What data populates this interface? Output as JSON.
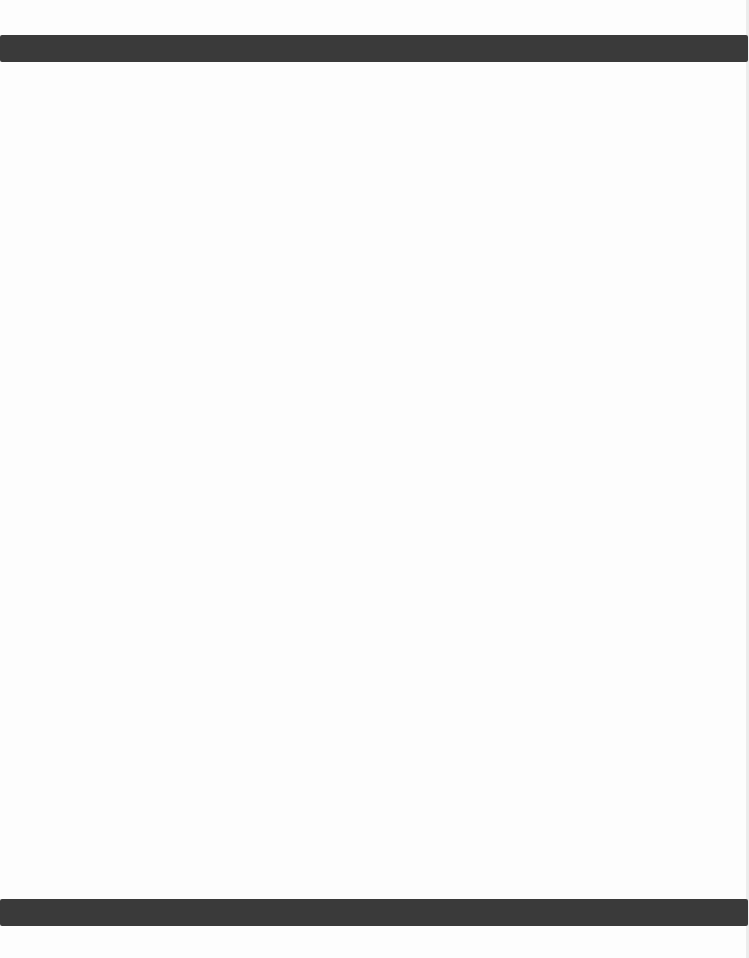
{
  "document": {
    "type": "blank scanned page",
    "background_color": "#fdfdfd",
    "rules": [
      {
        "name": "top-rule",
        "color": "#3a3a3a",
        "top_px": 35,
        "height_px": 27
      },
      {
        "name": "bottom-rule",
        "color": "#3a3a3a",
        "top_px": 899,
        "height_px": 27
      }
    ],
    "text": ""
  }
}
